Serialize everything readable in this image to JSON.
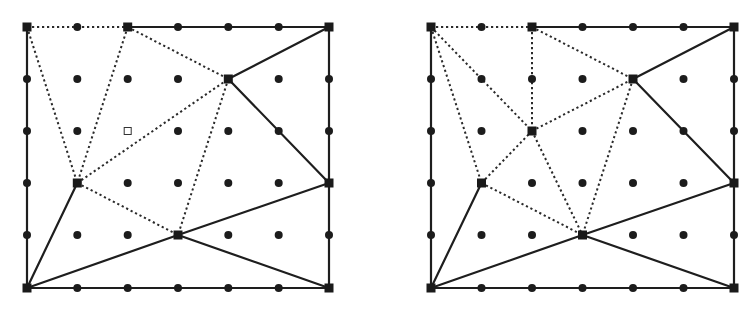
{
  "grid": {
    "cols": 7,
    "rows": 6,
    "row_y": [
      27,
      79,
      131,
      183,
      235,
      288
    ]
  },
  "colors": {
    "line": "#1e1e1e",
    "dot": "#1c1c1c",
    "background": "#ffffff"
  },
  "panels": [
    {
      "id": "left",
      "col_x": [
        27,
        77.3,
        127.7,
        178,
        228.3,
        278.7,
        329
      ],
      "vertices": [
        [
          0,
          0
        ],
        [
          2,
          0
        ],
        [
          6,
          0
        ],
        [
          4,
          1
        ],
        [
          1,
          3
        ],
        [
          6,
          3
        ],
        [
          3,
          4
        ],
        [
          0,
          5
        ],
        [
          6,
          5
        ]
      ],
      "hollow_markers": [
        [
          2,
          2
        ]
      ],
      "solid_edges": [
        [
          [
            2,
            0
          ],
          [
            6,
            0
          ]
        ],
        [
          [
            6,
            0
          ],
          [
            6,
            5
          ]
        ],
        [
          [
            0,
            5
          ],
          [
            6,
            5
          ]
        ],
        [
          [
            0,
            0
          ],
          [
            0,
            5
          ]
        ],
        [
          [
            6,
            0
          ],
          [
            4,
            1
          ]
        ],
        [
          [
            4,
            1
          ],
          [
            6,
            3
          ]
        ],
        [
          [
            6,
            3
          ],
          [
            3,
            4
          ]
        ],
        [
          [
            3,
            4
          ],
          [
            6,
            5
          ]
        ],
        [
          [
            3,
            4
          ],
          [
            0,
            5
          ]
        ],
        [
          [
            1,
            3
          ],
          [
            0,
            5
          ]
        ]
      ],
      "dotted_edges": [
        [
          [
            0,
            0
          ],
          [
            2,
            0
          ]
        ],
        [
          [
            0,
            0
          ],
          [
            1,
            3
          ]
        ],
        [
          [
            2,
            0
          ],
          [
            1,
            3
          ]
        ],
        [
          [
            2,
            0
          ],
          [
            4,
            1
          ]
        ],
        [
          [
            1,
            3
          ],
          [
            4,
            1
          ]
        ],
        [
          [
            1,
            3
          ],
          [
            3,
            4
          ]
        ],
        [
          [
            4,
            1
          ],
          [
            3,
            4
          ]
        ]
      ]
    },
    {
      "id": "right",
      "col_x": [
        431,
        481.5,
        532,
        582.5,
        633,
        683.5,
        734
      ],
      "vertices": [
        [
          0,
          0
        ],
        [
          2,
          0
        ],
        [
          6,
          0
        ],
        [
          4,
          1
        ],
        [
          2,
          2
        ],
        [
          1,
          3
        ],
        [
          6,
          3
        ],
        [
          3,
          4
        ],
        [
          0,
          5
        ],
        [
          6,
          5
        ]
      ],
      "hollow_markers": [],
      "solid_edges": [
        [
          [
            2,
            0
          ],
          [
            6,
            0
          ]
        ],
        [
          [
            6,
            0
          ],
          [
            6,
            5
          ]
        ],
        [
          [
            0,
            5
          ],
          [
            6,
            5
          ]
        ],
        [
          [
            0,
            0
          ],
          [
            0,
            5
          ]
        ],
        [
          [
            6,
            0
          ],
          [
            4,
            1
          ]
        ],
        [
          [
            4,
            1
          ],
          [
            6,
            3
          ]
        ],
        [
          [
            6,
            3
          ],
          [
            3,
            4
          ]
        ],
        [
          [
            3,
            4
          ],
          [
            6,
            5
          ]
        ],
        [
          [
            3,
            4
          ],
          [
            0,
            5
          ]
        ],
        [
          [
            1,
            3
          ],
          [
            0,
            5
          ]
        ]
      ],
      "dotted_edges": [
        [
          [
            0,
            0
          ],
          [
            2,
            0
          ]
        ],
        [
          [
            0,
            0
          ],
          [
            1,
            3
          ]
        ],
        [
          [
            0,
            0
          ],
          [
            2,
            2
          ]
        ],
        [
          [
            2,
            0
          ],
          [
            2,
            2
          ]
        ],
        [
          [
            2,
            0
          ],
          [
            4,
            1
          ]
        ],
        [
          [
            2,
            2
          ],
          [
            4,
            1
          ]
        ],
        [
          [
            2,
            2
          ],
          [
            1,
            3
          ]
        ],
        [
          [
            2,
            2
          ],
          [
            3,
            4
          ]
        ],
        [
          [
            1,
            3
          ],
          [
            3,
            4
          ]
        ],
        [
          [
            4,
            1
          ],
          [
            3,
            4
          ]
        ]
      ]
    }
  ]
}
